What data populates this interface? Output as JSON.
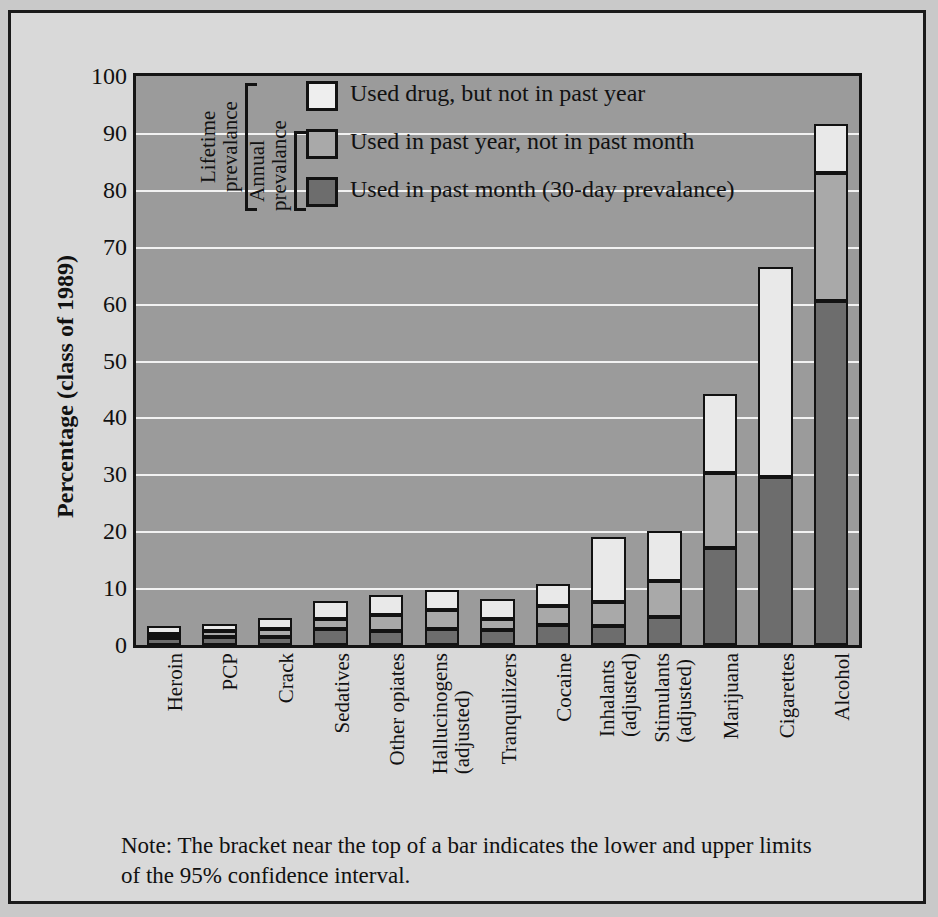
{
  "chart_data": {
    "type": "bar",
    "subtype": "stacked-vertical",
    "title": "",
    "xlabel": "",
    "ylabel": "Percentage (class of 1989)",
    "ylim": [
      0,
      100
    ],
    "ytick_step": 10,
    "ytick_labels": [
      "0",
      "10",
      "20",
      "30",
      "40",
      "50",
      "60",
      "70",
      "80",
      "90",
      "100"
    ],
    "grid": "horizontal",
    "legend_position": "inside-top-left",
    "categories": [
      "Heroin",
      "PCP",
      "Crack",
      "Sedatives",
      "Other opiates",
      "Hallucinogens (adjusted)",
      "Tranquilizers",
      "Cocaine",
      "Inhalants (adjusted)",
      "Stimulants (adjusted)",
      "Marijuana",
      "Cigarettes",
      "Alcohol"
    ],
    "category_lines": [
      [
        "Heroin"
      ],
      [
        "PCP"
      ],
      [
        "Crack"
      ],
      [
        "Sedatives"
      ],
      [
        "Other opiates"
      ],
      [
        "Hallucinogens",
        "(adjusted)"
      ],
      [
        "Tranquilizers"
      ],
      [
        "Cocaine"
      ],
      [
        "Inhalants",
        "(adjusted)"
      ],
      [
        "Stimulants",
        "(adjusted)"
      ],
      [
        "Marijuana"
      ],
      [
        "Cigarettes"
      ],
      [
        "Alcohol"
      ]
    ],
    "series": [
      {
        "name": "Used in past month (30-day prevalance)",
        "key": "dark",
        "color": "#6d6d6d",
        "values": [
          1.3,
          1.4,
          1.4,
          2.8,
          2.4,
          2.9,
          2.6,
          3.5,
          3.3,
          4.9,
          17.0,
          29.5,
          60.5
        ]
      },
      {
        "name": "Used in past year, not in past month",
        "key": "med",
        "color": "#a9a9a9",
        "values": [
          0.7,
          1.0,
          1.5,
          1.8,
          2.9,
          3.3,
          1.9,
          3.4,
          4.2,
          6.4,
          13.2,
          0.0,
          22.5
        ]
      },
      {
        "name": "Used drug, but not in past year",
        "key": "light",
        "color": "#e9e9e9",
        "values": [
          1.3,
          1.3,
          1.8,
          3.1,
          3.5,
          3.5,
          3.6,
          3.9,
          11.5,
          8.7,
          14.0,
          37.0,
          8.5
        ]
      }
    ],
    "totals": [
      3.3,
      3.7,
      4.7,
      7.7,
      8.8,
      9.7,
      8.1,
      10.8,
      19.0,
      20.0,
      44.2,
      66.5,
      91.5
    ],
    "annotations": {
      "bracket_lifetime": "Lifetime\nprevalance",
      "bracket_annual": "Annual\nprevalance"
    },
    "note": "Note:  The bracket near the top of a bar indicates the lower and upper limits of the 95% confidence interval."
  },
  "axis": {
    "ylabel": "Percentage (class of 1989)",
    "yticks": [
      "100",
      "90",
      "80",
      "70",
      "60",
      "50",
      "40",
      "30",
      "20",
      "10",
      "0"
    ]
  },
  "legend": {
    "items": [
      {
        "swatch": "light",
        "label": "Used drug, but not in past year"
      },
      {
        "swatch": "med",
        "label": "Used in past year, not in past month"
      },
      {
        "swatch": "dark",
        "label": "Used in past month (30-day prevalance)"
      }
    ],
    "brackets": [
      {
        "label_line1": "Lifetime",
        "label_line2": "prevalance"
      },
      {
        "label_line1": "Annual",
        "label_line2": "prevalance"
      }
    ]
  },
  "note": {
    "line1": "Note:  The bracket near the top of a bar indicates the lower and upper limits",
    "line2": "of the 95% confidence interval."
  },
  "colors": {
    "page_background": "#d9d9d9",
    "plot_background": "#9b9b9b",
    "gridline": "#f2f2f2",
    "outline": "#121212",
    "light": "#e9e9e9",
    "medium": "#a9a9a9",
    "dark": "#6d6d6d"
  }
}
